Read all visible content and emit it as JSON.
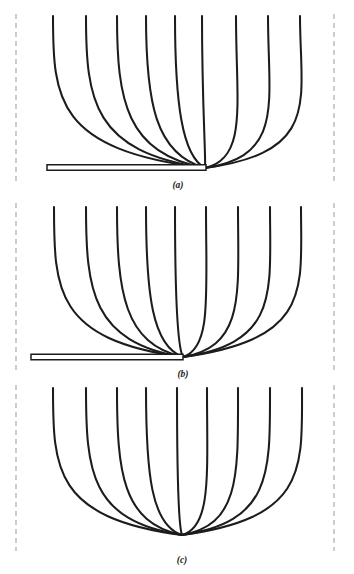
{
  "figure": {
    "width": 354,
    "height": 574,
    "background_color": "#ffffff",
    "line_color": "#1c1c1c",
    "boundary_color": "#a8a8a8",
    "plate_fill_color": "#ffffff",
    "label_color": "#1a1a1a",
    "panel_count": 3,
    "curves_per_panel": 9
  },
  "chart_data": {
    "type": "line",
    "title": "",
    "xlabel": "",
    "ylabel": "",
    "grid": false,
    "legend": false,
    "panels": [
      {
        "label": "(a)",
        "label_x": 178,
        "label_y": 188,
        "has_plate": true,
        "plate": {
          "x1": 47,
          "x2": 206,
          "y": 167.5,
          "thickness": 5.5
        },
        "converge_x": 205,
        "converge_y": 168,
        "top_y": 16,
        "boundary_top": 14,
        "boundary_bottom": 182,
        "curve_tops": [
          53,
          86,
          117,
          146,
          175,
          202,
          236,
          268,
          300
        ],
        "curve_ctrl_x": [
          56,
          93,
          126,
          155,
          182,
          206,
          248,
          285,
          322
        ],
        "curve_ctrl_y": [
          150,
          152,
          153,
          154,
          156,
          158,
          158,
          156,
          152
        ]
      },
      {
        "label": "(b)",
        "label_x": 183,
        "label_y": 377,
        "has_plate": true,
        "plate": {
          "x1": 31,
          "x2": 183,
          "y": 357.0,
          "thickness": 5.5
        },
        "converge_x": 183,
        "converge_y": 357,
        "top_y": 207,
        "boundary_top": 203,
        "boundary_bottom": 372,
        "curve_tops": [
          54,
          86,
          117,
          146,
          175,
          206,
          238,
          270,
          301
        ],
        "curve_ctrl_x": [
          55,
          92,
          124,
          152,
          178,
          212,
          246,
          280,
          313
        ],
        "curve_ctrl_y": [
          340,
          342,
          344,
          346,
          348,
          348,
          346,
          343,
          339
        ]
      },
      {
        "label": "(c)",
        "label_x": 182,
        "label_y": 563,
        "has_plate": false,
        "plate": null,
        "converge_x": 182,
        "converge_y": 535,
        "top_y": 388,
        "boundary_top": 385,
        "boundary_bottom": 551,
        "curve_tops": [
          53,
          86,
          117,
          146,
          177,
          207,
          238,
          270,
          302
        ],
        "curve_ctrl_x": [
          54,
          90,
          122,
          151,
          179,
          212,
          241,
          273,
          308
        ],
        "curve_ctrl_y": [
          518,
          521,
          523,
          525,
          527,
          527,
          525,
          522,
          518
        ]
      }
    ],
    "boundaries": {
      "left_x": 16,
      "right_x": 334
    }
  }
}
